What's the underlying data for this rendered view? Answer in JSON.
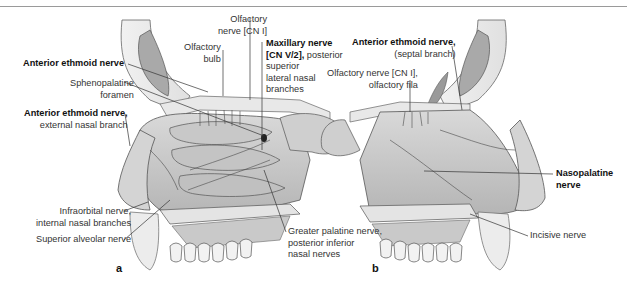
{
  "figure": {
    "panels": [
      {
        "id": "a",
        "label": "a",
        "view": "lateral nasal wall",
        "labels": [
          {
            "key": "olfactory_nerve",
            "line1": "Olfactory",
            "line2": "nerve [CN I]"
          },
          {
            "key": "olfactory_bulb",
            "line1": "Olfactory",
            "line2": "bulb"
          },
          {
            "key": "anterior_ethmoid_nerve",
            "bold": "Anterior ethmoid nerve"
          },
          {
            "key": "sphenopalatine_foramen",
            "line1": "Sphenopalatine",
            "line2": "foramen"
          },
          {
            "key": "anterior_ethmoid_external",
            "bold": "Anterior ethmoid nerve,",
            "line2": "external nasal branch"
          },
          {
            "key": "maxillary_nerve",
            "bold1": "Maxillary nerve",
            "bold2": "[CN V/2],",
            "rest2": " posterior",
            "line3": "superior",
            "line4": "lateral nasal",
            "line5": "branches"
          },
          {
            "key": "infraorbital_nerve",
            "line1": "Infraorbital nerve,",
            "line2": "internal nasal branches"
          },
          {
            "key": "superior_alveolar_nerve",
            "line1": "Superior alveolar nerve"
          },
          {
            "key": "greater_palatine_nerve",
            "line1": "Greater palatine nerve,",
            "line2": "posterior inferior",
            "line3": "nasal nerves"
          }
        ]
      },
      {
        "id": "b",
        "label": "b",
        "view": "nasal septum",
        "labels": [
          {
            "key": "anterior_ethmoid_septal",
            "bold": "Anterior ethmoid nerve,",
            "line2": "(septal branch)"
          },
          {
            "key": "olfactory_fila",
            "line1": "Olfactory nerve [CN I],",
            "line2": "olfactory fila"
          },
          {
            "key": "nasopalatine_nerve",
            "bold1": "Nasopalatine",
            "bold2": "nerve"
          },
          {
            "key": "incisive_nerve",
            "line1": "Incisive nerve"
          }
        ]
      }
    ]
  }
}
